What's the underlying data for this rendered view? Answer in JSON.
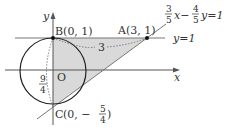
{
  "diagram": {
    "axes": {
      "x_label": "x",
      "y_label": "y",
      "origin_label": "O"
    },
    "points": {
      "B": {
        "label": "B(0, 1)",
        "x": 0,
        "y": 1
      },
      "A": {
        "label": "A(3, 1)",
        "x": 3,
        "y": 1
      },
      "C": {
        "label_prefix": "C",
        "label_open": "(0, −",
        "num": "5",
        "den": "4",
        "label_close": ")",
        "x": 0,
        "y": -1.25
      }
    },
    "lines": {
      "horizontal": {
        "label": "y=1"
      },
      "slanted": {
        "coef1_num": "3",
        "coef1_den": "5",
        "mid": "x−",
        "coef2_num": "4",
        "coef2_den": "5",
        "tail": "y=1"
      }
    },
    "annotations": {
      "ab_length": "3",
      "bc_length_num": "9",
      "bc_length_den": "4"
    },
    "colors": {
      "shade": "#d9d9d9",
      "stroke": "#333333",
      "grid": "#777777"
    }
  }
}
